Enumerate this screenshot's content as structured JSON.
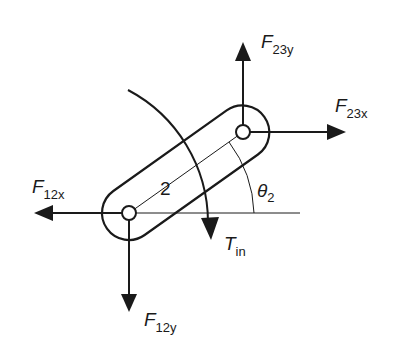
{
  "diagram": {
    "link_label": "2",
    "angle": {
      "symbol": "θ",
      "subscript": "2"
    },
    "torque": {
      "symbol": "T",
      "subscript": "in"
    },
    "forces": {
      "f23y": {
        "symbol": "F",
        "subscript": "23y"
      },
      "f23x": {
        "symbol": "F",
        "subscript": "23x"
      },
      "f12x": {
        "symbol": "F",
        "subscript": "12x"
      },
      "f12y": {
        "symbol": "F",
        "subscript": "12y"
      }
    },
    "colors": {
      "ink": "#1a1a1a",
      "background": "#ffffff"
    }
  }
}
